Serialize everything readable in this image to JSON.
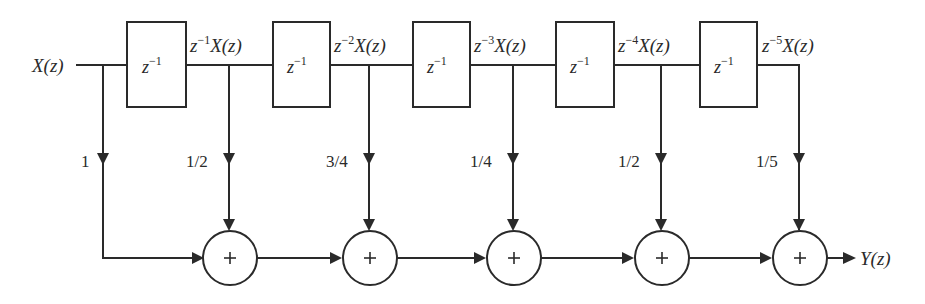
{
  "diagram": {
    "type": "FIR filter block diagram (direct form)",
    "input": {
      "label": "X(z)"
    },
    "output": {
      "label": "Y(z)"
    },
    "delay_blocks": [
      {
        "label": "z",
        "exponent": "−1"
      },
      {
        "label": "z",
        "exponent": "−1"
      },
      {
        "label": "z",
        "exponent": "−1"
      },
      {
        "label": "z",
        "exponent": "−1"
      },
      {
        "label": "z",
        "exponent": "−1"
      }
    ],
    "tap_signals": [
      {
        "prefix": "z",
        "exponent": "−1",
        "suffix": "X(z)"
      },
      {
        "prefix": "z",
        "exponent": "−2",
        "suffix": "X(z)"
      },
      {
        "prefix": "z",
        "exponent": "−3",
        "suffix": "X(z)"
      },
      {
        "prefix": "z",
        "exponent": "−4",
        "suffix": "X(z)"
      },
      {
        "prefix": "z",
        "exponent": "−5",
        "suffix": "X(z)"
      }
    ],
    "gains": [
      "1",
      "1/2",
      "3/4",
      "1/4",
      "1/2",
      "1/5"
    ],
    "summers": [
      {
        "symbol": "+"
      },
      {
        "symbol": "+"
      },
      {
        "symbol": "+"
      },
      {
        "symbol": "+"
      },
      {
        "symbol": "+"
      }
    ],
    "colors": {
      "ink": "#2a2a2a",
      "background": "#ffffff"
    }
  }
}
